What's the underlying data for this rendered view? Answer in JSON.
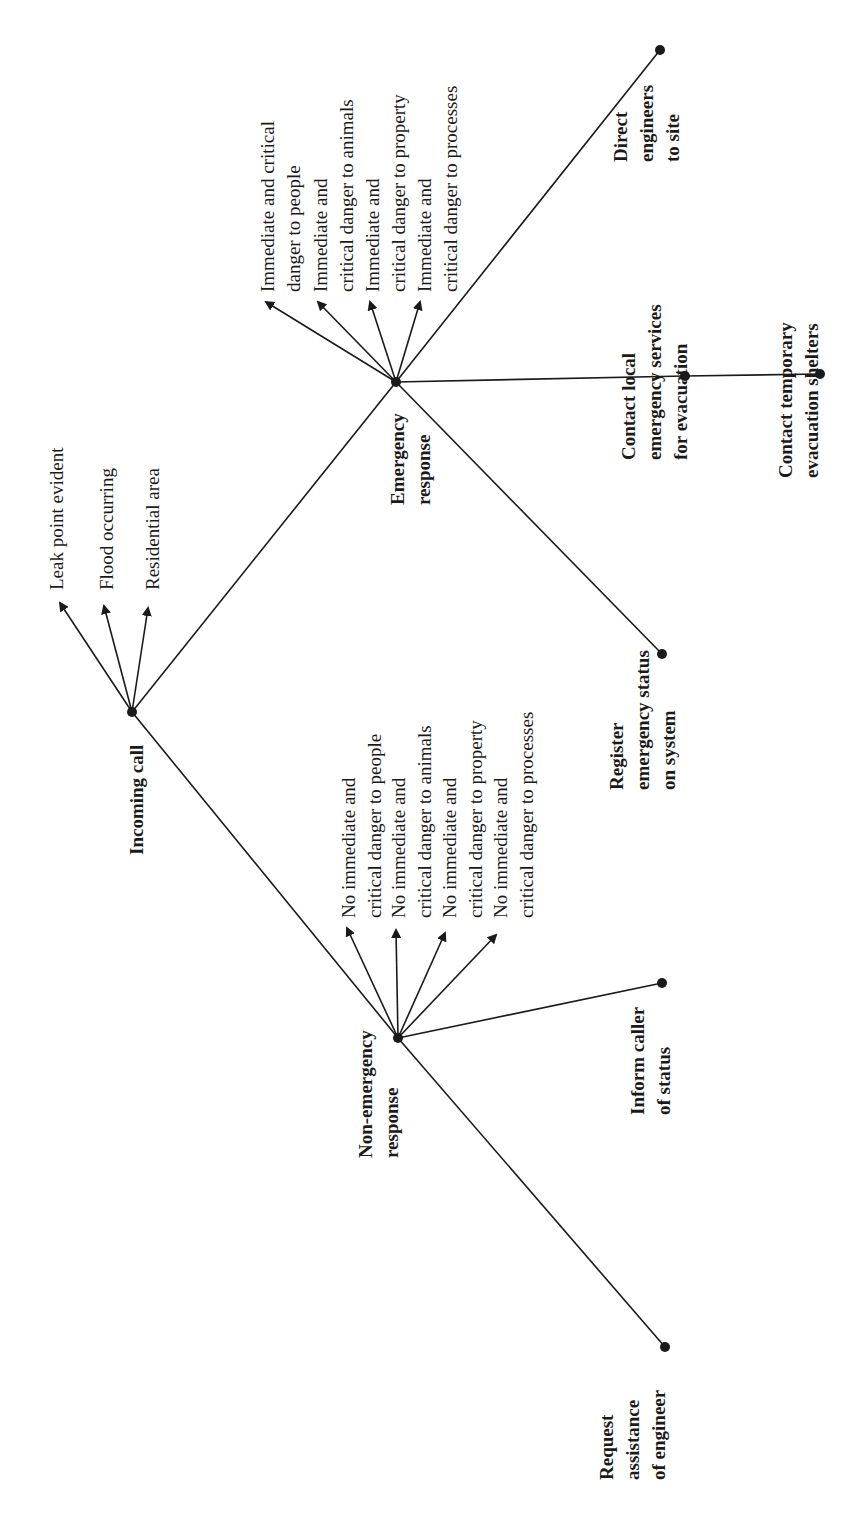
{
  "diagram": {
    "root": {
      "label": "Incoming call"
    },
    "root_conditions": [
      "Leak point evident",
      "Flood occurring",
      "Residential area"
    ],
    "emergency": {
      "label": "Emergency response",
      "conditions": [
        "Immediate and critical\ndanger to people",
        "Immediate and\ncritical danger to animals",
        "Immediate and\ncritical danger to property",
        "Immediate and\ncritical danger to processes"
      ],
      "actions": [
        "Direct\nengineers\nto site",
        "Contact local\nemergency services\nfor evacuation",
        "Contact temporary\nevacuation shelters",
        "Register\nemergency status\non system"
      ]
    },
    "non_emergency": {
      "label": "Non-emergency\nresponse",
      "conditions": [
        "No immediate and\ncritical danger to people",
        "No immediate and\ncritical danger to animals",
        "No immediate and\ncritical danger to property",
        "No immediate and\ncritical danger to processes"
      ],
      "actions": [
        "Inform caller\nof status",
        "Request\nassistance\nof engineer"
      ]
    },
    "emergency_label": "Emergency\nresponse",
    "colors": {
      "line": "#1a1a1a",
      "background": "#ffffff"
    }
  }
}
